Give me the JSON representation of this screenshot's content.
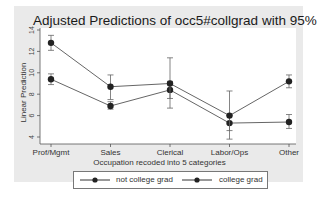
{
  "chart_data": {
    "type": "line",
    "title": "Adjusted Predictions of occ5#collgrad with 95% CIs",
    "xlabel": "Occupation recoded into 5 categories",
    "ylabel": "Linear Prediction",
    "categories": [
      "Prof/Mgmt",
      "Sales",
      "Clerical",
      "Labor/Ops",
      "Other"
    ],
    "yticks": [
      4,
      6,
      8,
      10,
      12,
      14
    ],
    "ylim": [
      3.5,
      14.5
    ],
    "grid": false,
    "legend_position": "bottom",
    "series": [
      {
        "name": "not college grad",
        "values": [
          9.4,
          6.9,
          8.4,
          5.3,
          5.4
        ],
        "ci_low": [
          8.9,
          6.6,
          7.6,
          4.6,
          4.8
        ],
        "ci_high": [
          9.9,
          7.3,
          9.2,
          6.0,
          6.1
        ]
      },
      {
        "name": "college grad",
        "values": [
          12.8,
          8.7,
          9.0,
          6.0,
          9.2
        ],
        "ci_low": [
          12.1,
          7.5,
          6.7,
          3.8,
          8.6
        ],
        "ci_high": [
          13.5,
          9.8,
          11.4,
          8.3,
          9.8
        ]
      }
    ]
  },
  "legend": {
    "items": [
      "not college grad",
      "college grad"
    ]
  }
}
